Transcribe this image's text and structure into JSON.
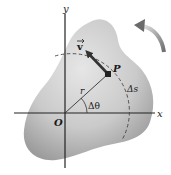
{
  "diagram": {
    "type": "rigid-body-rotation",
    "labels": {
      "y_axis": "y",
      "x_axis": "x",
      "origin": "O",
      "point": "P",
      "velocity": "v",
      "radius": "r",
      "angle": "Δθ",
      "arc_length": "Δs"
    },
    "colors": {
      "body_light": "#d9d9d9",
      "body_dark": "#a8a8a8",
      "axis": "#222222",
      "arrow": "#333333",
      "rotation_arrow_light": "#d0d0d0",
      "rotation_arrow_dark": "#7a7a7a",
      "dashed_arc": "#444444"
    },
    "geometry": {
      "origin": [
        65,
        113
      ],
      "point_p": [
        108,
        74
      ],
      "velocity_tip": [
        85,
        50
      ],
      "arc_radius": 58
    }
  }
}
